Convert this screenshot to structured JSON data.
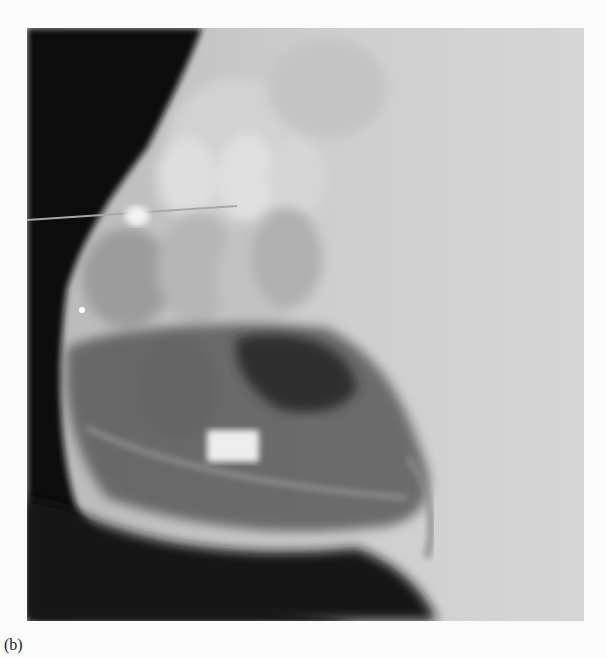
{
  "figure": {
    "caption": "(b)",
    "image_alt": "Lateral cephalometric radiograph showing maxillary and mandibular teeth, a horizontal wire at the occlusal plane, and a rectangular radiopaque marker in the mandible",
    "colors": {
      "background": "#fbfbfb",
      "soft_tissue_dark": "#0d0d0d",
      "bone_light": "#d9d9d9",
      "field_gray": "#c8c8c8"
    }
  }
}
